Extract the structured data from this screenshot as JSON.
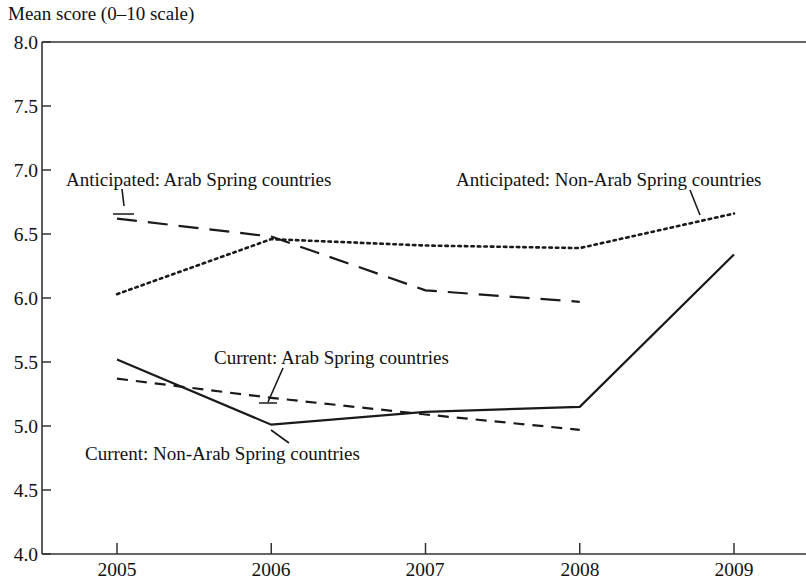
{
  "chart_data": {
    "type": "line",
    "title": "Mean score (0–10 scale)",
    "xlabel": "",
    "ylabel": "Mean score (0–10 scale)",
    "x": [
      2005,
      2006,
      2007,
      2008,
      2009
    ],
    "xtick_labels": [
      "2005",
      "2006",
      "2007",
      "2008",
      "2009"
    ],
    "ytick_labels": [
      "8.0",
      "7.5",
      "7.0",
      "6.5",
      "6.0",
      "5.5",
      "5.0",
      "4.5",
      "4.0"
    ],
    "ytick_values": [
      8.0,
      7.5,
      7.0,
      6.5,
      6.0,
      5.5,
      5.0,
      4.5,
      4.0
    ],
    "ylim": [
      4.0,
      8.0
    ],
    "xlim": [
      2005,
      2009
    ],
    "grid": false,
    "legend_position": "inline-annotations",
    "series": [
      {
        "name": "Anticipated: Arab Spring countries",
        "style": "dashed",
        "values": [
          6.62,
          6.48,
          6.06,
          5.97,
          null
        ]
      },
      {
        "name": "Anticipated: Non-Arab Spring countries",
        "style": "dotted",
        "values": [
          6.03,
          6.46,
          6.41,
          6.39,
          6.66
        ]
      },
      {
        "name": "Current: Arab Spring countries",
        "style": "short-dashed",
        "values": [
          5.37,
          5.22,
          5.09,
          4.97,
          null
        ]
      },
      {
        "name": "Current: Non-Arab Spring countries",
        "style": "solid",
        "values": [
          5.52,
          5.01,
          5.11,
          5.15,
          6.34
        ]
      }
    ],
    "annotations": [
      {
        "text": "Anticipated: Arab Spring countries",
        "series": "Anticipated: Arab Spring countries"
      },
      {
        "text": "Anticipated: Non-Arab Spring countries",
        "series": "Anticipated: Non-Arab Spring countries"
      },
      {
        "text": "Current: Arab Spring countries",
        "series": "Current: Arab Spring countries"
      },
      {
        "text": "Current: Non-Arab Spring countries",
        "series": "Current: Non-Arab Spring countries"
      }
    ],
    "colors": {
      "line": "#1a1a1a",
      "axis": "#333333",
      "background": "#ffffff"
    }
  }
}
